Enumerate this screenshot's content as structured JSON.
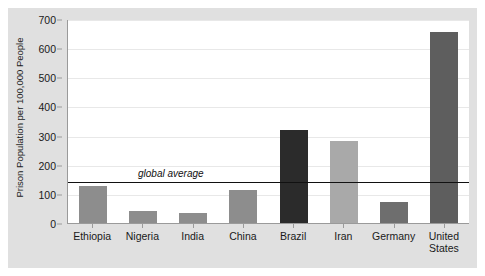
{
  "chart_data": {
    "type": "bar",
    "title": "",
    "xlabel": "",
    "ylabel": "Prison Population per 100,000 People",
    "ylim": [
      0,
      700
    ],
    "ytick_labels": [
      "700",
      "600",
      "500",
      "400",
      "300",
      "200",
      "100",
      "0"
    ],
    "ytick_values": [
      700,
      600,
      500,
      400,
      300,
      200,
      100,
      0
    ],
    "grid": true,
    "legend": "none",
    "categories": [
      "Ethiopia",
      "Nigeria",
      "India",
      "China",
      "Brazil",
      "Iran",
      "Germany",
      "United States"
    ],
    "values": [
      127,
      40,
      33,
      115,
      320,
      283,
      71,
      655
    ],
    "bar_colors": [
      "#8d8d8d",
      "#8d8d8d",
      "#8d8d8d",
      "#8d8d8d",
      "#2b2b2b",
      "#a9a9a9",
      "#6e6e6e",
      "#5e5e5e"
    ],
    "annotations": [
      {
        "name": "global-average",
        "label": "global average",
        "value": 145,
        "style": "horizontal reference line"
      }
    ]
  },
  "panel": {
    "background": "#e0e0e0",
    "plot_background": "#ffffff",
    "axis_color": "#9a9a9a",
    "gridline_color": "#e8e8e8",
    "reference_line_color": "#111111"
  }
}
